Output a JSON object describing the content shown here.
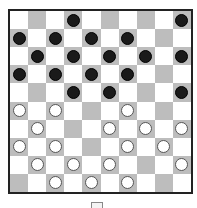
{
  "game": "Checkers (10x10 International Draughts)",
  "board": {
    "size": 10,
    "colors": {
      "light": "#ffffff",
      "dark": "#bdbdbd",
      "border": "#222222"
    },
    "rows": [
      "...b.....b",
      "b.b.b.b...",
      ".b.b.b.b.b",
      "b.b.b.b...",
      "...b.b...b",
      "w.w...w...",
      ".w...w.w.w",
      "w.w...w.w.",
      ".w.w.w...w",
      "..w.w.w..."
    ]
  },
  "pieces": {
    "black_count": 18,
    "white_count": 18
  },
  "bottom_button": {
    "icon": "menu-icon"
  }
}
